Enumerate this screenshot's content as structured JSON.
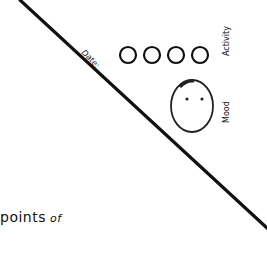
{
  "labels": {
    "date": "Date:",
    "activity": "Activity",
    "mood": "Mood",
    "points": "points",
    "of": "of"
  },
  "activity_circles": [
    {
      "cx": 128,
      "cy": 55,
      "r": 8
    },
    {
      "cx": 152,
      "cy": 55,
      "r": 8
    },
    {
      "cx": 176,
      "cy": 55,
      "r": 8
    },
    {
      "cx": 200,
      "cy": 55,
      "r": 8
    }
  ],
  "mood_face": {
    "cx": 192,
    "cy": 106,
    "rx": 21,
    "ry": 26,
    "expression": "neutral-no-mouth"
  },
  "divider_line": {
    "x1": 20,
    "y1": 0,
    "x2": 267,
    "y2": 228
  },
  "colors": {
    "ink": "#111111",
    "background": "#ffffff"
  }
}
